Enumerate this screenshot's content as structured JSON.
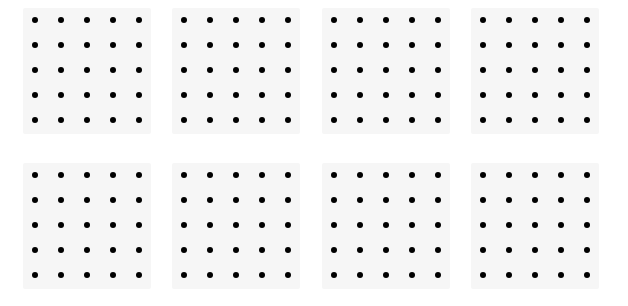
{
  "figure": {
    "rows": 2,
    "columns": 4,
    "grid_size": {
      "rows": 5,
      "cols": 5
    },
    "colors": {
      "background": "#ffffff",
      "panel": "#f6f6f6",
      "dot": "#000000"
    },
    "panels": [
      {
        "id": 1,
        "x": 23,
        "y": 8,
        "dots": "5x5"
      },
      {
        "id": 2,
        "x": 172,
        "y": 8,
        "dots": "5x5"
      },
      {
        "id": 3,
        "x": 322,
        "y": 8,
        "dots": "5x5"
      },
      {
        "id": 4,
        "x": 471,
        "y": 8,
        "dots": "5x5"
      },
      {
        "id": 5,
        "x": 23,
        "y": 163,
        "dots": "5x5"
      },
      {
        "id": 6,
        "x": 172,
        "y": 163,
        "dots": "5x5"
      },
      {
        "id": 7,
        "x": 322,
        "y": 163,
        "dots": "5x5"
      },
      {
        "id": 8,
        "x": 471,
        "y": 163,
        "dots": "5x5"
      }
    ],
    "dot_offset": {
      "x": 12,
      "y": 12
    },
    "dot_spacing": {
      "x": 26,
      "y": 25
    }
  }
}
